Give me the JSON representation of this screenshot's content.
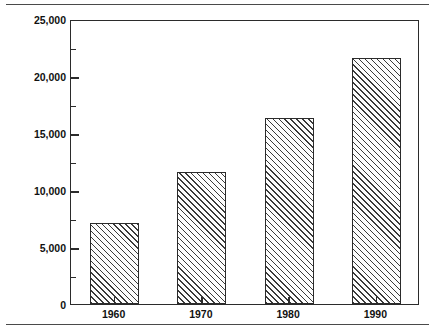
{
  "chart_data": {
    "type": "bar",
    "title": "",
    "subtitle": "",
    "xlabel": "",
    "ylabel": "Billions of Dollars",
    "categories": [
      "1960",
      "1970",
      "1980",
      "1990"
    ],
    "values": [
      7100,
      11600,
      16300,
      21600
    ],
    "series": [
      {
        "name": "Billions of Dollars",
        "values": [
          7100,
          11600,
          16300,
          21600
        ]
      }
    ],
    "ylim": [
      0,
      25000
    ],
    "ytick_values": [
      0,
      5000,
      10000,
      15000,
      20000,
      25000
    ],
    "ytick_labels": [
      "0",
      "5,000",
      "10,000",
      "15,000",
      "20,000",
      "25,000"
    ],
    "yminor_tick_values": [
      2500,
      7500,
      12500,
      17500,
      22500
    ],
    "grid": false,
    "legend": null,
    "legend_position": "none",
    "annotations": [],
    "bar_fill": "diagonal-hatch",
    "bar_edge_color": "#2b2b2b",
    "frame": true
  },
  "figure": {
    "rule_top_name": "top-divider-rule",
    "rule_bottom_name": "bottom-divider-rule"
  }
}
